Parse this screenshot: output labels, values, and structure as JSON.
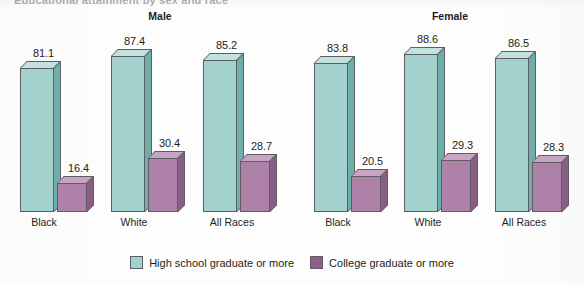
{
  "figure": {
    "title_remnant": "Educational attainment by sex and race",
    "panels": [
      {
        "name": "Male",
        "label": "Male",
        "center_x": 160
      },
      {
        "name": "Female",
        "label": "Female",
        "center_x": 450
      }
    ]
  },
  "legend": {
    "items": [
      {
        "key": "hs",
        "label": "High school graduate or more",
        "color": "#a3d2ce",
        "swatch": "teal"
      },
      {
        "key": "college",
        "label": "College graduate or more",
        "color": "#8f5f8a",
        "swatch": "purple"
      }
    ]
  },
  "colors": {
    "teal_front": "#a3d2ce",
    "teal_top": "#c2e2de",
    "teal_side": "#6fafaa",
    "purple_front": "#ae82a8",
    "purple_top": "#c8a4c3",
    "purple_side": "#8a5d85",
    "outline": "#5d5d66",
    "text": "#231f20",
    "background": "#fdfdfd"
  },
  "chart_data": {
    "type": "bar",
    "title": "Educational attainment by sex and race",
    "xlabel": "",
    "ylabel": "Percent",
    "ylim": [
      0,
      100
    ],
    "grid": false,
    "legend_position": "bottom-center",
    "style": "3d-grouped-bar",
    "panels": [
      "Male",
      "Female"
    ],
    "categories": [
      "Black",
      "White",
      "All Races"
    ],
    "series": [
      {
        "name": "High school graduate or more",
        "color": "#a3d2ce",
        "panel_values": {
          "Male": [
            81.1,
            87.4,
            85.2
          ],
          "Female": [
            83.8,
            88.6,
            86.5
          ]
        }
      },
      {
        "name": "College graduate or more",
        "color": "#8f5f8a",
        "panel_values": {
          "Male": [
            16.4,
            30.4,
            28.7
          ],
          "Female": [
            20.5,
            29.3,
            28.3
          ]
        }
      }
    ]
  },
  "bars": [
    {
      "panel": "Male",
      "category": "Black",
      "series": "hs",
      "value": 81.1,
      "label": "81.1",
      "x": 20,
      "w": 34,
      "label_x": 40,
      "cat_x": 44
    },
    {
      "panel": "Male",
      "category": "Black",
      "series": "college",
      "value": 16.4,
      "label": "16.4",
      "x": 57,
      "w": 30,
      "label_x": 75,
      "cat_x": null
    },
    {
      "panel": "Male",
      "category": "White",
      "series": "hs",
      "value": 87.4,
      "label": "87.4",
      "x": 111,
      "w": 34,
      "label_x": 131,
      "cat_x": 134
    },
    {
      "panel": "Male",
      "category": "White",
      "series": "college",
      "value": 30.4,
      "label": "30.4",
      "x": 148,
      "w": 30,
      "label_x": 166,
      "cat_x": null
    },
    {
      "panel": "Male",
      "category": "All Races",
      "series": "hs",
      "value": 85.2,
      "label": "85.2",
      "x": 203,
      "w": 34,
      "label_x": 223,
      "cat_x": 232
    },
    {
      "panel": "Male",
      "category": "All Races",
      "series": "college",
      "value": 28.7,
      "label": "28.7",
      "x": 240,
      "w": 30,
      "label_x": 258,
      "cat_x": null
    },
    {
      "panel": "Female",
      "category": "Black",
      "series": "hs",
      "value": 83.8,
      "label": "83.8",
      "x": 314,
      "w": 34,
      "label_x": 334,
      "cat_x": 338
    },
    {
      "panel": "Female",
      "category": "Black",
      "series": "college",
      "value": 20.5,
      "label": "20.5",
      "x": 351,
      "w": 30,
      "label_x": 369,
      "cat_x": null
    },
    {
      "panel": "Female",
      "category": "White",
      "series": "hs",
      "value": 88.6,
      "label": "88.6",
      "x": 404,
      "w": 34,
      "label_x": 424,
      "cat_x": 428
    },
    {
      "panel": "Female",
      "category": "White",
      "series": "college",
      "value": 29.3,
      "label": "29.3",
      "x": 441,
      "w": 30,
      "label_x": 459,
      "cat_x": null
    },
    {
      "panel": "Female",
      "category": "All Races",
      "series": "hs",
      "value": 86.5,
      "label": "86.5",
      "x": 495,
      "w": 34,
      "label_x": 515,
      "cat_x": 524
    },
    {
      "panel": "Female",
      "category": "All Races",
      "series": "college",
      "value": 28.3,
      "label": "28.3",
      "x": 532,
      "w": 30,
      "label_x": 550,
      "cat_x": null
    }
  ],
  "axis": {
    "baseline_y": 212,
    "pixels_per_unit": 1.78,
    "category_label_y": 216
  }
}
